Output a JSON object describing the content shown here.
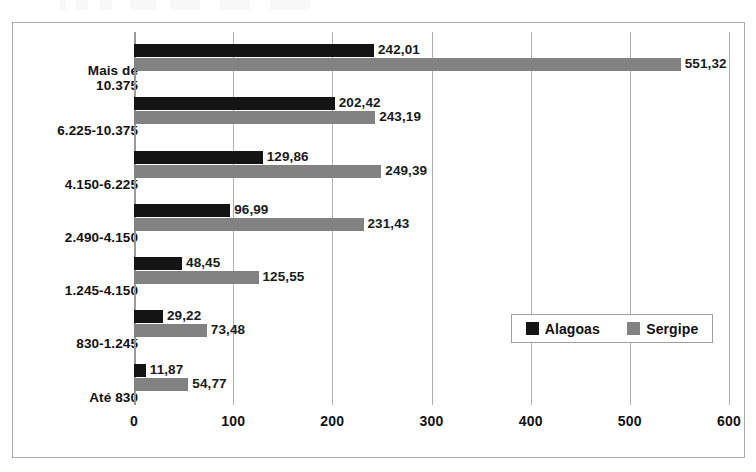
{
  "chart_data": {
    "type": "bar",
    "orientation": "horizontal",
    "title": "",
    "xlabel": "",
    "ylabel": "",
    "xlim": [
      0,
      600
    ],
    "xticks": [
      0,
      100,
      200,
      300,
      400,
      500,
      600
    ],
    "xtick_labels": [
      "0",
      "100",
      "200",
      "300",
      "400",
      "500",
      "600"
    ],
    "grid": true,
    "grid_axis": "x",
    "legend_position": "inner-right",
    "categories": [
      "Mais de\n10.375",
      "6.225-10.375",
      "4.150-6.225",
      "2.490-4.150",
      "1.245-4.150",
      "830-1.245",
      "Até 830"
    ],
    "series": [
      {
        "name": "Alagoas",
        "color": "#141414",
        "values": [
          242.01,
          202.42,
          129.86,
          96.99,
          48.45,
          29.22,
          11.87
        ],
        "value_labels": [
          "242,01",
          "202,42",
          "129,86",
          "96,99",
          "48,45",
          "29,22",
          "11,87"
        ]
      },
      {
        "name": "Sergipe",
        "color": "#828282",
        "values": [
          551.32,
          243.19,
          249.39,
          231.43,
          125.55,
          73.48,
          54.77
        ],
        "value_labels": [
          "551,32",
          "243,19",
          "249,39",
          "231,43",
          "125,55",
          "73,48",
          "54,77"
        ]
      }
    ]
  },
  "legend": {
    "entries": [
      {
        "label": "Alagoas",
        "color": "#141414"
      },
      {
        "label": "Sergipe",
        "color": "#828282"
      }
    ]
  },
  "colors": {
    "alagoas": "#141414",
    "sergipe": "#828282",
    "gridline": "#b0b0b0",
    "border": "#a9a9a9",
    "background": "#ffffff",
    "text": "#111111"
  }
}
